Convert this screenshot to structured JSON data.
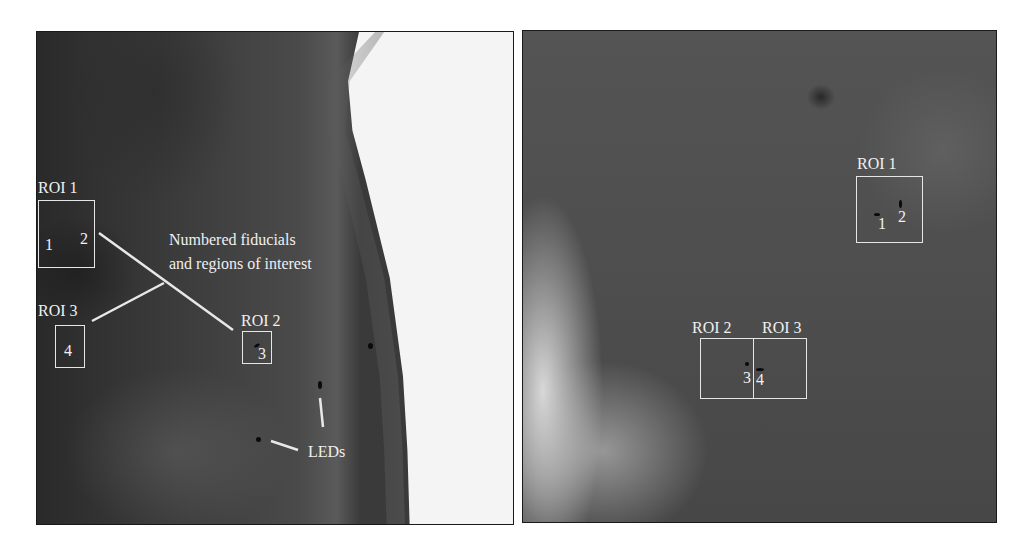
{
  "figure": {
    "left_panel": {
      "rois": [
        {
          "label": "ROI 1",
          "fiducials": [
            "1",
            "2"
          ]
        },
        {
          "label": "ROI 2",
          "fiducials": [
            "3"
          ]
        },
        {
          "label": "ROI 3",
          "fiducials": [
            "4"
          ]
        }
      ],
      "annotations": {
        "fiducials_line1": "Numbered fiducials",
        "fiducials_line2": "and regions of interest",
        "leds": "LEDs"
      }
    },
    "right_panel": {
      "rois": [
        {
          "label": "ROI 1",
          "fiducials": [
            "1",
            "2"
          ]
        },
        {
          "label": "ROI 2",
          "fiducials": [
            "3"
          ]
        },
        {
          "label": "ROI 3",
          "fiducials": [
            "4"
          ]
        }
      ]
    }
  }
}
